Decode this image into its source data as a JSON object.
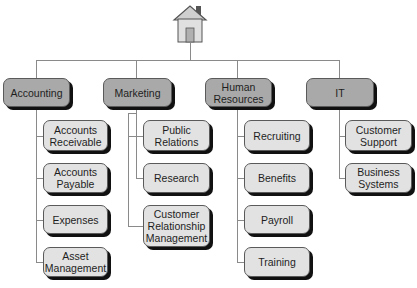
{
  "root": {
    "icon": "house-icon"
  },
  "departments": [
    {
      "label": "Accounting",
      "children": [
        "Accounts Receivable",
        "Accounts Payable",
        "Expenses",
        "Asset Management"
      ]
    },
    {
      "label": "Marketing",
      "children": [
        "Public Relations",
        "Research",
        "Customer Relationship Management"
      ]
    },
    {
      "label": "Human Resources",
      "children": [
        "Recruiting",
        "Benefits",
        "Payroll",
        "Training"
      ]
    },
    {
      "label": "IT",
      "children": [
        "Customer Support",
        "Business Systems"
      ]
    }
  ],
  "colors": {
    "parent_fill": "#a9a9a9",
    "child_fill": "#e2e2e2",
    "line": "#8a8a8a",
    "shadow": "#111111"
  }
}
